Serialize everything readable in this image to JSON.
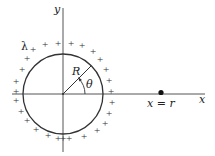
{
  "diagram": {
    "labels": {
      "y_axis": "y",
      "x_axis": "x",
      "lambda": "λ",
      "radius": "R",
      "angle": "θ",
      "point": "x = r"
    },
    "charge_sign": "+",
    "colors": {
      "stroke": "#333333",
      "background": "#ffffff"
    }
  }
}
